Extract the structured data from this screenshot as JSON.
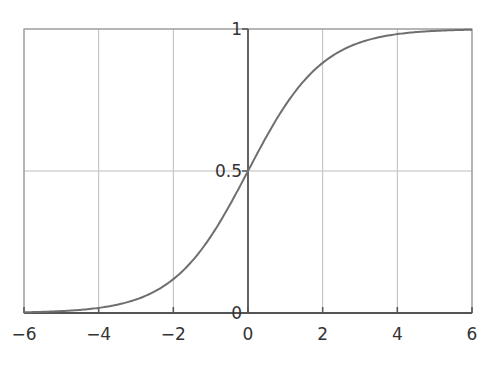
{
  "chart_data": {
    "type": "line",
    "title": "",
    "xlabel": "",
    "ylabel": "",
    "function": "logistic sigmoid 1/(1+e^-x)",
    "xlim": [
      -6,
      6
    ],
    "ylim": [
      0,
      1
    ],
    "grid": true,
    "legend": null,
    "x_ticks": [
      "−6",
      "−4",
      "−2",
      "0",
      "2",
      "4",
      "6"
    ],
    "y_ticks": [
      "0",
      "0.5",
      "1"
    ],
    "series": [
      {
        "name": "sigmoid",
        "x": [
          -6,
          -5,
          -4,
          -3,
          -2,
          -1,
          0,
          1,
          2,
          3,
          4,
          5,
          6
        ],
        "y": [
          0.0025,
          0.0067,
          0.018,
          0.047,
          0.119,
          0.269,
          0.5,
          0.731,
          0.881,
          0.953,
          0.982,
          0.993,
          0.9975
        ]
      }
    ],
    "colors": {
      "curve": "#6f6f6f",
      "grid": "#bdbdbd",
      "axis": "#555555",
      "frame": "#9a9a9a"
    }
  }
}
